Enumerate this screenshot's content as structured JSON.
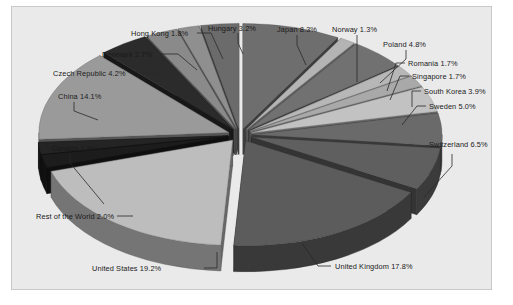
{
  "figure": {
    "background_color": "#eaeaea",
    "border_color": "#c9c9c9",
    "page_color": "#ffffff",
    "label_color": "#1a1a1a",
    "leader_color": "#2a2a2a"
  },
  "chart_data": {
    "type": "pie",
    "title": "",
    "subtitle": "",
    "xlabel": "",
    "ylabel": "",
    "grid": false,
    "legend_position": "none",
    "style": "exploded 3D pie chart, grayscale",
    "value_unit": "percent",
    "categories": [
      "Japan",
      "Norway",
      "Poland",
      "Romania",
      "Singapore",
      "South Korea",
      "Sweden",
      "Switzerland",
      "United Kingdom",
      "United States",
      "Rest of the World",
      "Canada",
      "China",
      "Czech Republic",
      "Denmark",
      "Hong Kong",
      "Hungary"
    ],
    "values": [
      8.3,
      1.3,
      4.8,
      1.7,
      1.7,
      3.9,
      5.0,
      6.5,
      17.8,
      19.2,
      2.0,
      1.8,
      14.1,
      4.2,
      2.7,
      1.8,
      3.2
    ],
    "slice_colors": [
      "#6e6e6e",
      "#b4b4b4",
      "#717171",
      "#b7b7b7",
      "#a9a9a9",
      "#c2c2c2",
      "#6a6a6a",
      "#5f5f5f",
      "#5c5c5c",
      "#bdbdbd",
      "#1c1c1c",
      "#242424",
      "#9a9a9a",
      "#2b2b2b",
      "#8a8a8a",
      "#8f8f8f",
      "#6b6b6b"
    ],
    "labels": [
      {
        "name": "label-japan",
        "text": "Japan 8.3%"
      },
      {
        "name": "label-norway",
        "text": "Norway 1.3%"
      },
      {
        "name": "label-poland",
        "text": "Poland 4.8%"
      },
      {
        "name": "label-romania",
        "text": "Romania 1.7%"
      },
      {
        "name": "label-singapore",
        "text": "Singapore 1.7%"
      },
      {
        "name": "label-south-korea",
        "text": "South Korea 3.9%"
      },
      {
        "name": "label-sweden",
        "text": "Sweden 5.0%"
      },
      {
        "name": "label-switzerland",
        "text": "Switzerland 6.5%"
      },
      {
        "name": "label-united-kingdom",
        "text": "United Kingdom 17.8%"
      },
      {
        "name": "label-united-states",
        "text": "United States 19.2%"
      },
      {
        "name": "label-rest-of-the-world",
        "text": "Rest of the World 2.0%"
      },
      {
        "name": "label-canada",
        "text": "Canada 1.8%"
      },
      {
        "name": "label-china",
        "text": "China 14.1%"
      },
      {
        "name": "label-czech-republic",
        "text": "Czech Republic 4.2%"
      },
      {
        "name": "label-denmark",
        "text": "Denmark 2.7%"
      },
      {
        "name": "label-hong-kong",
        "text": "Hong Kong 1.8%"
      },
      {
        "name": "label-hungary",
        "text": "Hungary 3.2%"
      }
    ]
  }
}
